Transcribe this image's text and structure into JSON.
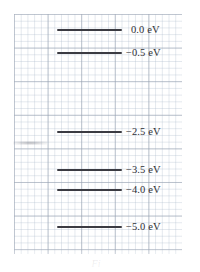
{
  "figure": {
    "kind": "energy-level-diagram",
    "background": "graph-paper",
    "paper_grid_color": "#aebccd",
    "paper_major_grid_color": "#96a0af",
    "level_color": "#3b3b42",
    "label_color": "#2f2f36",
    "caption_fragment": "Fi"
  },
  "chart_data": {
    "type": "line",
    "title": "",
    "xlabel": "",
    "ylabel": "",
    "units": "eV",
    "levels": [
      {
        "label": "0.0 eV",
        "value": 0.0,
        "y": 30,
        "line_start_x": 57,
        "line_end_x": 122,
        "label_x": 131
      },
      {
        "label": "−0.5 eV",
        "value": -0.5,
        "y": 53,
        "line_start_x": 57,
        "line_end_x": 122,
        "label_x": 126
      },
      {
        "label": "−2.5 eV",
        "value": -2.5,
        "y": 132,
        "line_start_x": 57,
        "line_end_x": 122,
        "label_x": 126
      },
      {
        "label": "−3.5 eV",
        "value": -3.5,
        "y": 170,
        "line_start_x": 57,
        "line_end_x": 122,
        "label_x": 126
      },
      {
        "label": "−4.0 eV",
        "value": -4.0,
        "y": 190,
        "line_start_x": 57,
        "line_end_x": 122,
        "label_x": 126
      },
      {
        "label": "−5.0 eV",
        "value": -5.0,
        "y": 227,
        "line_start_x": 57,
        "line_end_x": 122,
        "label_x": 126
      }
    ],
    "ylim": [
      -5.6,
      0.6
    ],
    "grid": true,
    "legend": null
  }
}
